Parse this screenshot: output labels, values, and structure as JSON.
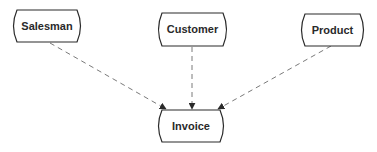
{
  "diagram": {
    "type": "entity-relationship",
    "colors": {
      "stroke": "#2a2a2a",
      "dashed_line": "#7a7a7a",
      "arrowhead": "#2a2a2a",
      "text": "#2a2a2a",
      "background": "#ffffff"
    },
    "nodes": [
      {
        "id": "salesman",
        "label": "Salesman"
      },
      {
        "id": "customer",
        "label": "Customer"
      },
      {
        "id": "product",
        "label": "Product"
      },
      {
        "id": "invoice",
        "label": "Invoice"
      }
    ],
    "edges": [
      {
        "from": "salesman",
        "to": "invoice",
        "style": "dashed",
        "arrow": "end"
      },
      {
        "from": "customer",
        "to": "invoice",
        "style": "dashed",
        "arrow": "end"
      },
      {
        "from": "product",
        "to": "invoice",
        "style": "dashed",
        "arrow": "end"
      }
    ]
  }
}
